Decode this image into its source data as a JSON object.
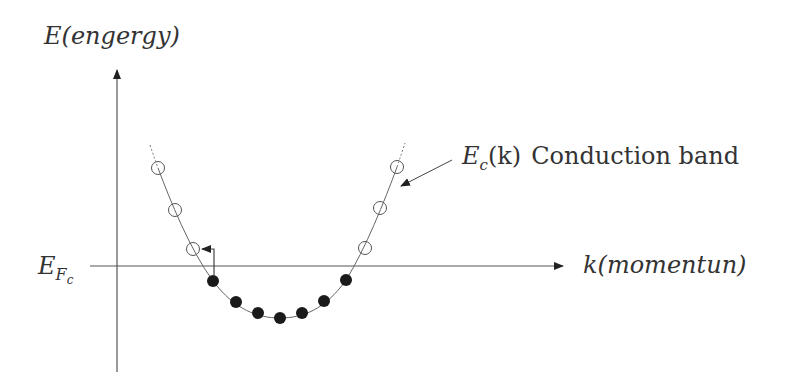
{
  "diagram": {
    "y_axis": {
      "label_main": "E",
      "label_paren": "(engergy)"
    },
    "x_axis": {
      "label_main": "k",
      "label_paren": "(momentun)"
    },
    "fermi_label": {
      "main": "E",
      "sub": "F",
      "subsub": "c"
    },
    "band_label": {
      "symbol": "E",
      "sub": "c",
      "arg": "(k)",
      "text": "Conduction band"
    },
    "empty_states": [
      {
        "x": 158,
        "y": 168
      },
      {
        "x": 175,
        "y": 210
      },
      {
        "x": 193,
        "y": 249
      },
      {
        "x": 365,
        "y": 248
      },
      {
        "x": 380,
        "y": 208
      },
      {
        "x": 397,
        "y": 167
      }
    ],
    "filled_states": [
      {
        "x": 213,
        "y": 281
      },
      {
        "x": 236,
        "y": 302
      },
      {
        "x": 258,
        "y": 313
      },
      {
        "x": 280,
        "y": 318
      },
      {
        "x": 302,
        "y": 313
      },
      {
        "x": 324,
        "y": 301
      },
      {
        "x": 346,
        "y": 280
      }
    ],
    "colors": {
      "line": "#555555",
      "dot": "#1a1a1a",
      "text": "#333333"
    }
  }
}
